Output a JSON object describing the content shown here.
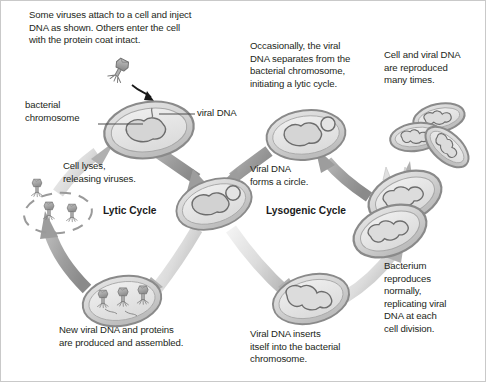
{
  "figure": {
    "background_color": "#ffffff",
    "border_color": "#c9c9c9",
    "text_color": "#231f20",
    "cell_fill_color": "#d9d9d9",
    "cell_outline_color": "#8c8c8c",
    "cell_interior_color": "#e8e8e8",
    "arrow_color": "#9a9a9a",
    "arrow_light_color": "#e3e3e3",
    "phage_color": "#a6a6a6"
  },
  "cycles": {
    "lytic": "Lytic Cycle",
    "lysogenic": "Lysogenic Cycle"
  },
  "labels": {
    "intro": "Some viruses attach to a cell and inject\nDNA as shown. Others enter the cell\nwith the protein coat intact.",
    "bacterial_chromosome": "bacterial\nchromosome",
    "viral_dna_pointer": "viral DNA",
    "cell_lyses": "Cell lyses,\nreleasing viruses.",
    "new_viral_dna": "New viral DNA and proteins\nare produced and assembled.",
    "viral_dna_circle": "Viral DNA\nforms a circle.",
    "occasionally": "Occasionally, the viral\nDNA separates from the\nbacterial chromosome,\ninitiating a lytic cycle.",
    "cell_and_viral_dna": "Cell and viral DNA\nare reproduced\nmany times.",
    "bacterium_reproduces": "Bacterium\nreproduces\nnormally,\nreplicating viral\nDNA at each\ncell division.",
    "viral_dna_inserts": "Viral DNA inserts\nitself into the bacterial\nchromosome."
  },
  "structures": {
    "infected_cell": "bacterium-with-injected-viral-dna",
    "center_cell": "bacterium-with-circular-viral-dna",
    "assembly_cell": "bacterium-with-assembled-phages",
    "lysed_cell": "lysed-cell-releasing-viruses",
    "prophage_cell": "bacterium-with-integrated-prophage",
    "dividing_cell": "dividing-bacterium-pair",
    "reproduced_cells": "three-reproduced-bacteria",
    "excision_cell": "bacterium-with-excised-viral-dna"
  }
}
